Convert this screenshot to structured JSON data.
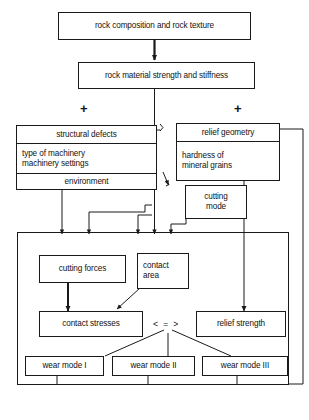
{
  "diagram": {
    "stroke_color": "#1a1a1a",
    "background_color": "#ffffff",
    "nodes": {
      "rock_composition": {
        "label": "rock composition and rock texture"
      },
      "rock_material": {
        "label": "rock material strength and stiffness"
      },
      "machinery_group": {
        "line1": "structural defects",
        "line2a": "type of machinery",
        "line2b": "machinery settings",
        "line3": "environment"
      },
      "relief_group": {
        "line1": "relief geometry",
        "line2a": "hardness of",
        "line2b": "mineral grains"
      },
      "cutting_mode": {
        "line1": "cutting",
        "line2": "mode"
      },
      "cutting_forces": {
        "label": "cutting forces"
      },
      "contact_area": {
        "line1": "contact",
        "line2": "area"
      },
      "contact_stresses": {
        "label": "contact stresses"
      },
      "relief_strength": {
        "label": "relief strength"
      },
      "wear_mode_1": {
        "label": "wear mode I"
      },
      "wear_mode_2": {
        "label": "wear mode II"
      },
      "wear_mode_3": {
        "label": "wear mode III"
      }
    },
    "symbols": {
      "plus_left": "+",
      "plus_right": "+",
      "comparator": "< = >"
    }
  }
}
